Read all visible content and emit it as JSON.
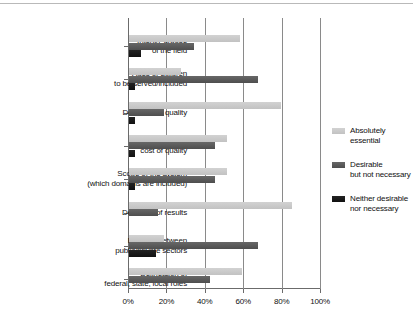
{
  "chart_data": {
    "type": "bar",
    "orientation": "horizontal",
    "title": "",
    "subtitle": "",
    "xlabel": "",
    "ylabel": "",
    "xlim": [
      0,
      100
    ],
    "xticks": [
      0,
      20,
      40,
      60,
      80,
      100
    ],
    "xtick_labels": [
      "0%",
      "20%",
      "40%",
      "60%",
      "80%",
      "100%"
    ],
    "grid": "vertical",
    "legend_position": "right",
    "categories": [
      "Intent/Purpose\nof the field",
      "Ages of children\nto be served/included",
      "Definition of quality",
      "Definition of the\ncost of quality",
      "Scope of the system\n(which domains are included)",
      "Definition of results",
      "Balance between\npublic/private sectors",
      "Delineation of\nfederal, state, local roles"
    ],
    "category_lines": [
      [
        "Intent/Purpose",
        "of the field"
      ],
      [
        "Ages of children",
        "to be served/included"
      ],
      [
        "Definition of quality"
      ],
      [
        "Definition of the",
        "cost of quality"
      ],
      [
        "Scope of the system",
        "(which domains are included)"
      ],
      [
        "Definition of results"
      ],
      [
        "Balance between",
        "public/private sectors"
      ],
      [
        "Delineation of",
        "federal, state, local roles"
      ]
    ],
    "series": [
      {
        "name": "Absolutely essential",
        "color": "#c8c8c8",
        "values": [
          58,
          27,
          79,
          51,
          51,
          85,
          18,
          59
        ]
      },
      {
        "name": "Desirable but not necessary",
        "color": "#585858",
        "values": [
          34,
          67,
          18,
          45,
          45,
          15,
          67,
          42
        ]
      },
      {
        "name": "Neither desirable nor necessary",
        "color": "#151515",
        "values": [
          6,
          3,
          3,
          3,
          3,
          0,
          14,
          0
        ]
      }
    ]
  },
  "legend": {
    "items": [
      {
        "label_lines": [
          "Absolutely essential"
        ],
        "swatch": "s0"
      },
      {
        "label_lines": [
          "Desirable",
          "but not necessary"
        ],
        "swatch": "s1"
      },
      {
        "label_lines": [
          "Neither desirable",
          "nor necessary"
        ],
        "swatch": "s2"
      }
    ]
  }
}
